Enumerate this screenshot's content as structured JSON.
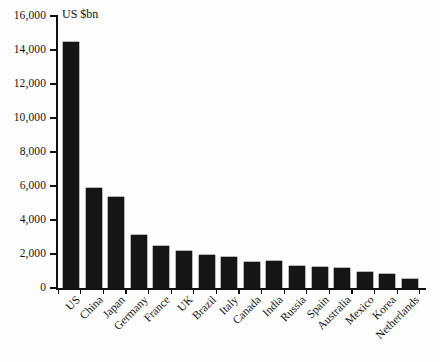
{
  "chart_data": {
    "type": "bar",
    "title": "",
    "unit_label": "US $bn",
    "xlabel": "",
    "ylabel": "",
    "ylim": [
      0,
      16000
    ],
    "grid": false,
    "legend": false,
    "y_ticks": [
      0,
      2000,
      4000,
      6000,
      8000,
      10000,
      12000,
      14000,
      16000
    ],
    "y_tick_labels": [
      "0",
      "2,000",
      "4,000",
      "6,000",
      "8,000",
      "10,000",
      "12,000",
      "14,000",
      "16,000"
    ],
    "categories": [
      "US",
      "China",
      "Japan",
      "Germany",
      "France",
      "UK",
      "Brazil",
      "Italy",
      "Canada",
      "India",
      "Russia",
      "Spain",
      "Australia",
      "Mexico",
      "Korea",
      "Netherlands"
    ],
    "values": [
      14450,
      5880,
      5350,
      3120,
      2470,
      2180,
      1950,
      1820,
      1530,
      1580,
      1300,
      1240,
      1180,
      940,
      830,
      530
    ],
    "bar_color": "#151515"
  },
  "colors": {
    "background": "#fdfdfd",
    "axis": "#111111",
    "bar": "#151515",
    "text": "#141414"
  }
}
